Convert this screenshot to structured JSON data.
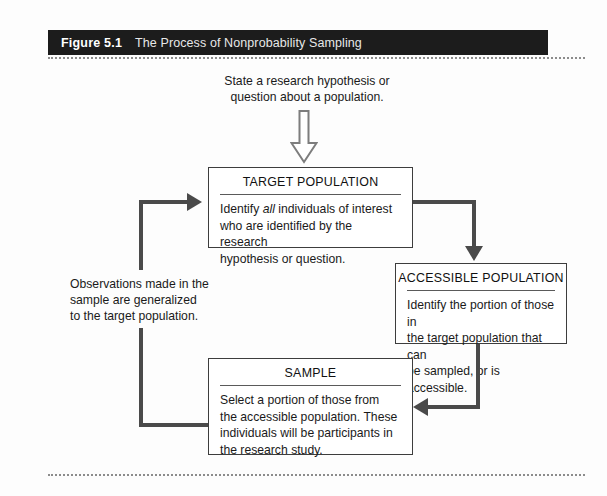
{
  "figure": {
    "number": "Figure 5.1",
    "caption": "The Process of Nonprobability Sampling",
    "header_bg": "#1c1c1c",
    "rule_color": "#8c8c8c"
  },
  "intro_text": {
    "line1": "State a research hypothesis or",
    "line2": "question about a population."
  },
  "boxes": {
    "target": {
      "title": "TARGET POPULATION",
      "body_line1_pre": "Identify ",
      "body_line1_em": "all",
      "body_line1_post": " individuals of interest",
      "body_line2": "who are identified by the research",
      "body_line3": "hypothesis or question."
    },
    "accessible": {
      "title": "ACCESSIBLE POPULATION",
      "body_line1": "Identify the portion of those in",
      "body_line2": "the target population that can",
      "body_line3": "be sampled, or is accessible."
    },
    "sample": {
      "title": "SAMPLE",
      "body_line1": "Select a portion of those from",
      "body_line2": "the accessible population. These",
      "body_line3": "individuals will be participants in",
      "body_line4": "the research study."
    }
  },
  "feedback_text": {
    "line1": "Observations made in the",
    "line2": "sample are generalized",
    "line3": "to the target population."
  },
  "connector_color": "#4a4a4a",
  "icons": {
    "down_block_arrow": "hollow-down-arrow-icon",
    "target_inflow_arrow": "arrow-right-icon",
    "accessible_inflow_arrow": "arrow-down-icon",
    "sample_inflow_arrow": "arrow-left-icon"
  }
}
